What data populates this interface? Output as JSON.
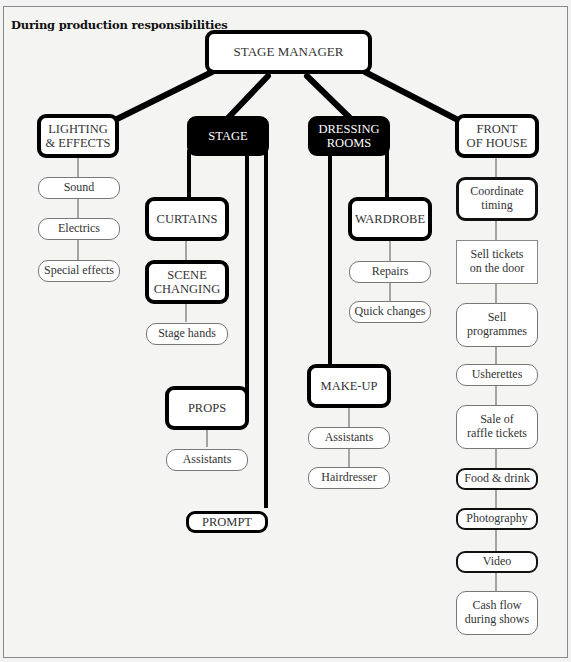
{
  "title": "During production responsibilities",
  "root": {
    "label": "STAGE MANAGER"
  },
  "departments": {
    "lighting": {
      "label": "LIGHTING\n& EFFECTS",
      "children": [
        "Sound",
        "Electrics",
        "Special effects"
      ]
    },
    "stage": {
      "label": "STAGE",
      "curtains": "CURTAINS",
      "scene_changing": "SCENE\nCHANGING",
      "stage_hands": "Stage hands",
      "props": "PROPS",
      "props_assistants": "Assistants",
      "prompt": "PROMPT"
    },
    "dressing": {
      "label": "DRESSING\nROOMS",
      "wardrobe": "WARDROBE",
      "wardrobe_children": [
        "Repairs",
        "Quick changes"
      ],
      "makeup": "MAKE-UP",
      "makeup_children": [
        "Assistants",
        "Hairdresser"
      ]
    },
    "front": {
      "label": "FRONT\nOF HOUSE",
      "children": [
        "Coordinate\ntiming",
        "Sell tickets\non the door",
        "Sell\nprogrammes",
        "Usherettes",
        "Sale of\nraffle tickets",
        "Food & drink",
        "Photography",
        "Video",
        "Cash flow\nduring shows"
      ]
    }
  },
  "colors": {
    "line": "#000000",
    "dark_box": "#000000",
    "background": "#f4f4f3"
  }
}
